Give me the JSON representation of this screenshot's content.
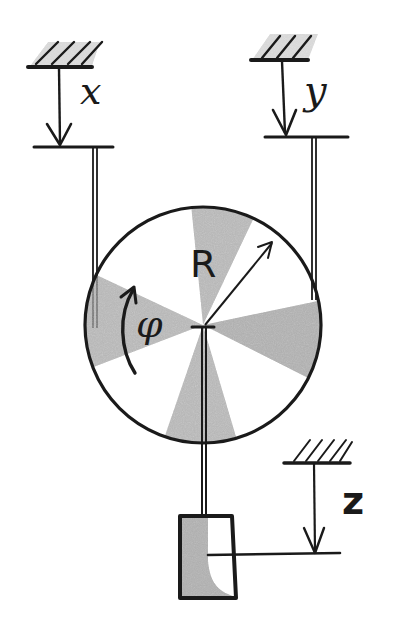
{
  "figure": {
    "type": "mechanics-sketch"
  },
  "labels": {
    "x": "x",
    "y": "y",
    "z": "z",
    "radius": "R",
    "angle": "φ"
  },
  "colors": {
    "ink": "#1a1a1a",
    "shade": "#9a9a9a",
    "background": "#ffffff"
  },
  "geometry": {
    "pulley_center": [
      203,
      325
    ],
    "pulley_radius": 118,
    "block": {
      "x": 180,
      "y": 516,
      "w": 58,
      "h": 82
    }
  }
}
